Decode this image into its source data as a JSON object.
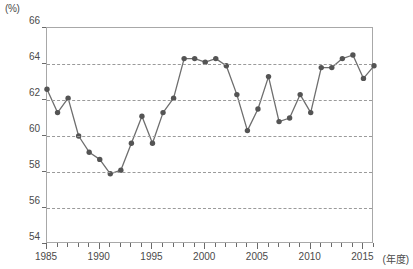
{
  "axis": {
    "unit_label": "(%)",
    "x_caption": "(年度)",
    "y_ticks": [
      66,
      64,
      62,
      60,
      58,
      56,
      54
    ],
    "x_ticks_major": [
      1985,
      1990,
      1995,
      2000,
      2005,
      2010,
      2015
    ]
  },
  "style": {
    "line_color": "#6e6e6e",
    "marker_color": "#545454",
    "grid_color": "#9a9a9a",
    "frame_color": "#a8a8a8",
    "text_color": "#4a4a4a"
  },
  "chart_data": {
    "type": "line",
    "title": "",
    "xlabel": "(年度)",
    "ylabel": "(%)",
    "xlim": [
      1985,
      2016
    ],
    "ylim": [
      54,
      66
    ],
    "grid": true,
    "legend": "none",
    "x": [
      1985,
      1986,
      1987,
      1988,
      1989,
      1990,
      1991,
      1992,
      1993,
      1994,
      1995,
      1996,
      1997,
      1998,
      1999,
      2000,
      2001,
      2002,
      2003,
      2004,
      2005,
      2006,
      2007,
      2008,
      2009,
      2010,
      2011,
      2012,
      2013,
      2014,
      2015,
      2016
    ],
    "categories": [
      "1985",
      "1986",
      "1987",
      "1988",
      "1989",
      "1990",
      "1991",
      "1992",
      "1993",
      "1994",
      "1995",
      "1996",
      "1997",
      "1998",
      "1999",
      "2000",
      "2001",
      "2002",
      "2003",
      "2004",
      "2005",
      "2006",
      "2007",
      "2008",
      "2009",
      "2010",
      "2011",
      "2012",
      "2013",
      "2014",
      "2015",
      "2016"
    ],
    "values": [
      62.6,
      61.3,
      62.1,
      60.0,
      59.1,
      58.7,
      57.9,
      58.1,
      59.6,
      61.1,
      59.6,
      61.3,
      62.1,
      64.3,
      64.3,
      64.1,
      64.3,
      63.9,
      62.3,
      60.3,
      61.5,
      63.3,
      60.8,
      61.0,
      62.3,
      61.3,
      63.8,
      63.8,
      64.3,
      64.5,
      63.2,
      63.9
    ]
  }
}
